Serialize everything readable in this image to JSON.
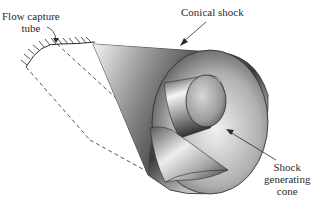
{
  "diagram": {
    "labels": {
      "flow_capture_tube": [
        "Flow capture",
        "tube"
      ],
      "conical_shock": "Conical shock",
      "shock_generating_cone": [
        "Shock",
        "generating",
        "cone"
      ]
    },
    "colors": {
      "line": "#2a2a2a",
      "shade_dark": "#2b2b2b",
      "shade_mid": "#8a8a8a",
      "shade_light": "#f2f2f2",
      "background": "#ffffff"
    }
  }
}
